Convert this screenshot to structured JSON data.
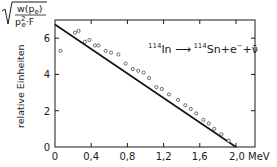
{
  "chart_data": {
    "type": "scatter",
    "title": "",
    "ylabel_formula": {
      "numerator": "w(p",
      "numerator_sub": "e",
      "numerator_close": ")",
      "denominator": "p",
      "denominator_sup": "2",
      "denominator_sub": "e",
      "denominator_rest": "·F"
    },
    "ylabel": "relative Einheiten",
    "xlabel": "MeV",
    "xlim": [
      0,
      2.21
    ],
    "ylim": [
      0,
      7.0
    ],
    "xticks": [
      0,
      0.4,
      0.8,
      1.2,
      1.6,
      2.0
    ],
    "xtick_labels": [
      "0",
      "0,4",
      "0,8",
      "1,2",
      "1,6",
      "2,0 MeV"
    ],
    "yticks": [
      0,
      2,
      4,
      6
    ],
    "ytick_labels": [
      "0",
      "2",
      "4",
      "6"
    ],
    "grid": false,
    "annotation": {
      "reactant_mass": "114",
      "reactant": "In",
      "arrow": "⟶",
      "product_mass": "114",
      "product": "Sn+e",
      "electron_charge": "−",
      "plus": "+",
      "antineutrino": "ν̄"
    },
    "series": [
      {
        "name": "measured",
        "marker": "open-circle",
        "x": [
          0.06,
          0.22,
          0.26,
          0.33,
          0.38,
          0.44,
          0.48,
          0.56,
          0.62,
          0.7,
          0.78,
          0.86,
          0.92,
          0.98,
          1.04,
          1.12,
          1.18,
          1.26,
          1.36,
          1.44,
          1.5,
          1.56,
          1.64,
          1.7,
          1.76,
          1.84,
          1.92
        ],
        "y": [
          5.3,
          6.3,
          6.4,
          5.8,
          5.9,
          5.6,
          5.6,
          5.3,
          5.2,
          5.1,
          4.6,
          4.3,
          4.2,
          4.1,
          3.8,
          3.3,
          3.2,
          2.9,
          2.6,
          2.3,
          2.1,
          1.85,
          1.5,
          1.3,
          1.0,
          0.7,
          0.35
        ]
      },
      {
        "name": "fit",
        "type": "line",
        "x": [
          0,
          2.0
        ],
        "y": [
          6.75,
          0
        ]
      }
    ]
  }
}
